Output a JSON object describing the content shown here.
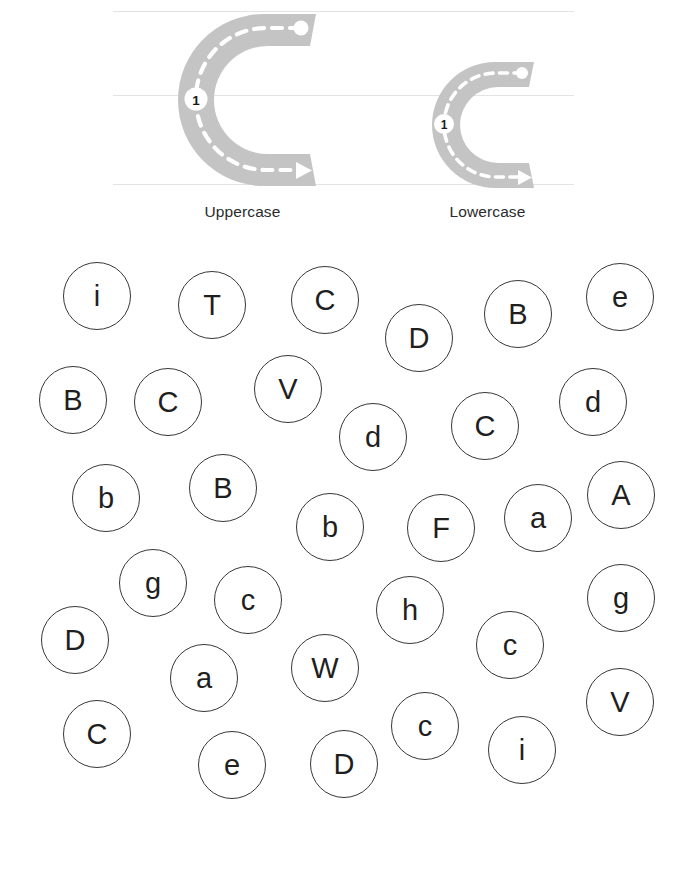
{
  "worksheet": {
    "target_letter": "C",
    "guide_lines": 3
  },
  "trace": {
    "uppercase": {
      "glyph": "C",
      "caption": "Uppercase",
      "stroke_number": "1",
      "icon": "letter-c-trace-arrow"
    },
    "lowercase": {
      "glyph": "c",
      "caption": "Lowercase",
      "stroke_number": "1",
      "icon": "letter-c-trace-arrow"
    }
  },
  "colors": {
    "trace_fill": "#c4c4c4",
    "guide_line": "#e3e3e3",
    "circle_stroke": "#373737",
    "letter_text": "#1f1f1f",
    "dash": "#ffffff",
    "stroke_marker_bg": "#ffffff",
    "stroke_marker_text": "#1a1a1a",
    "page_bg": "#ffffff"
  },
  "bubbles": [
    {
      "letter": "i",
      "x": 97,
      "y": 296,
      "r": 34
    },
    {
      "letter": "T",
      "x": 212,
      "y": 305,
      "r": 34
    },
    {
      "letter": "C",
      "x": 325,
      "y": 300,
      "r": 34
    },
    {
      "letter": "D",
      "x": 419,
      "y": 338,
      "r": 34
    },
    {
      "letter": "B",
      "x": 518,
      "y": 314,
      "r": 34
    },
    {
      "letter": "e",
      "x": 620,
      "y": 297,
      "r": 34
    },
    {
      "letter": "B",
      "x": 73,
      "y": 400,
      "r": 34
    },
    {
      "letter": "C",
      "x": 168,
      "y": 402,
      "r": 34
    },
    {
      "letter": "V",
      "x": 288,
      "y": 389,
      "r": 34
    },
    {
      "letter": "d",
      "x": 373,
      "y": 437,
      "r": 34
    },
    {
      "letter": "C",
      "x": 485,
      "y": 426,
      "r": 34
    },
    {
      "letter": "d",
      "x": 593,
      "y": 402,
      "r": 34
    },
    {
      "letter": "b",
      "x": 106,
      "y": 498,
      "r": 34
    },
    {
      "letter": "B",
      "x": 223,
      "y": 488,
      "r": 34
    },
    {
      "letter": "b",
      "x": 330,
      "y": 527,
      "r": 34
    },
    {
      "letter": "F",
      "x": 441,
      "y": 528,
      "r": 34
    },
    {
      "letter": "a",
      "x": 538,
      "y": 518,
      "r": 34
    },
    {
      "letter": "A",
      "x": 621,
      "y": 495,
      "r": 34
    },
    {
      "letter": "g",
      "x": 153,
      "y": 583,
      "r": 34
    },
    {
      "letter": "c",
      "x": 248,
      "y": 600,
      "r": 34
    },
    {
      "letter": "h",
      "x": 410,
      "y": 610,
      "r": 34
    },
    {
      "letter": "c",
      "x": 510,
      "y": 645,
      "r": 34
    },
    {
      "letter": "g",
      "x": 621,
      "y": 598,
      "r": 34
    },
    {
      "letter": "D",
      "x": 75,
      "y": 640,
      "r": 34
    },
    {
      "letter": "a",
      "x": 204,
      "y": 678,
      "r": 34
    },
    {
      "letter": "W",
      "x": 325,
      "y": 668,
      "r": 34
    },
    {
      "letter": "C",
      "x": 97,
      "y": 734,
      "r": 34
    },
    {
      "letter": "c",
      "x": 425,
      "y": 726,
      "r": 34
    },
    {
      "letter": "i",
      "x": 522,
      "y": 750,
      "r": 34
    },
    {
      "letter": "V",
      "x": 620,
      "y": 702,
      "r": 34
    },
    {
      "letter": "e",
      "x": 232,
      "y": 765,
      "r": 34
    },
    {
      "letter": "D",
      "x": 344,
      "y": 764,
      "r": 34
    }
  ]
}
